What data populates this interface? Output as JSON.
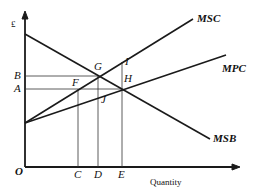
{
  "diagram": {
    "axes": {
      "y_label": "£",
      "x_label": "Quantity",
      "origin_label": "O"
    },
    "curves": {
      "msc": "MSC",
      "mpc": "MPC",
      "msb": "MSB"
    },
    "price_levels": {
      "b": "B",
      "a": "A"
    },
    "quantity_levels": {
      "c": "C",
      "d": "D",
      "e": "E"
    },
    "points": {
      "g": "G",
      "f": "F",
      "h": "H",
      "i": "I",
      "j": "J"
    },
    "colors": {
      "line": "#1a1a1a",
      "background": "#ffffff"
    }
  }
}
